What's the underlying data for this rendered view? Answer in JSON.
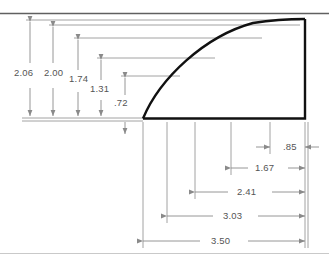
{
  "drawing": {
    "title": "curved-profile-ordinate-dimensioned-part",
    "background_color": "#ffffff",
    "outline_color": "#111111",
    "dimension_color": "#8a8a8a",
    "text_color": "#555555",
    "border_color": "#555555"
  },
  "vertical_dimensions": [
    {
      "label": "2.06",
      "value": 2.06,
      "line_x": 30,
      "label_x": 14,
      "label_y": 76,
      "top_y": 20,
      "baseline_y": 118
    },
    {
      "label": "2.00",
      "value": 2.0,
      "line_x": 53,
      "label_x": 44,
      "label_y": 76,
      "top_y": 25,
      "baseline_y": 118
    },
    {
      "label": "1.74",
      "value": 1.74,
      "line_x": 78,
      "label_x": 69,
      "label_y": 82,
      "top_y": 38,
      "baseline_y": 118
    },
    {
      "label": "1.31",
      "value": 1.31,
      "line_x": 101,
      "label_x": 90,
      "label_y": 92,
      "top_y": 58,
      "baseline_y": 118
    },
    {
      "label": ".72",
      "value": 0.72,
      "line_x": 125,
      "label_x": 114,
      "label_y": 106,
      "top_y": 76,
      "baseline_y": 118
    }
  ],
  "horizontal_dimensions": [
    {
      "label": ".85",
      "value": 0.85,
      "row_y": 147,
      "from_x": 270,
      "to_x": 305,
      "label_x": 283,
      "label_y": 150
    },
    {
      "label": "1.67",
      "value": 1.67,
      "row_y": 168,
      "from_x": 231,
      "to_x": 305,
      "label_x": 255,
      "label_y": 171
    },
    {
      "label": "2.41",
      "value": 2.41,
      "row_y": 192,
      "from_x": 195,
      "to_x": 305,
      "label_x": 237,
      "label_y": 195
    },
    {
      "label": "3.03",
      "value": 3.03,
      "row_y": 216,
      "from_x": 167,
      "to_x": 305,
      "label_x": 223,
      "label_y": 219
    },
    {
      "label": "3.50",
      "value": 3.5,
      "row_y": 241,
      "from_x": 143,
      "to_x": 305,
      "label_x": 211,
      "label_y": 244
    }
  ],
  "geometry": {
    "curve_start_x": 143,
    "curve_start_y": 118,
    "curve_end_x": 305,
    "curve_end_y": 19,
    "baseline_y": 118,
    "right_edge_x": 305
  }
}
